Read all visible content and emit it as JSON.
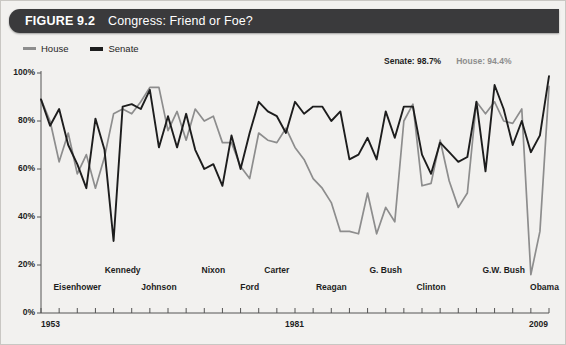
{
  "header": {
    "figure_number": "FIGURE 9.2",
    "title": "Congress: Friend or Foe?"
  },
  "legend": {
    "items": [
      {
        "label": "House",
        "color": "#8d8d8d"
      },
      {
        "label": "Senate",
        "color": "#1d1d1d"
      }
    ]
  },
  "annotations": [
    {
      "label": "Senate: 98.7%",
      "color": "#1d1d1d"
    },
    {
      "label": "House: 94.4%",
      "color": "#8d8d8d"
    }
  ],
  "axis": {
    "y_ticks": [
      "0%",
      "20%",
      "40%",
      "60%",
      "80%",
      "100%"
    ],
    "x_start_label": "1953",
    "x_mid_label": "1981",
    "x_end_label": "2009"
  },
  "presidents": [
    {
      "name": "Eisenhower",
      "year": 1957,
      "row": 1
    },
    {
      "name": "Kennedy",
      "year": 1962,
      "row": 0
    },
    {
      "name": "Johnson",
      "year": 1966,
      "row": 1
    },
    {
      "name": "Nixon",
      "year": 1972,
      "row": 0
    },
    {
      "name": "Ford",
      "year": 1976,
      "row": 1
    },
    {
      "name": "Carter",
      "year": 1979,
      "row": 0
    },
    {
      "name": "Reagan",
      "year": 1985,
      "row": 1
    },
    {
      "name": "G. Bush",
      "year": 1991,
      "row": 0
    },
    {
      "name": "Clinton",
      "year": 1996,
      "row": 1
    },
    {
      "name": "G.W. Bush",
      "year": 2004,
      "row": 0
    },
    {
      "name": "Obama",
      "year": 2008.5,
      "row": 1
    }
  ],
  "chart_data": {
    "type": "line",
    "title": "Congress: Friend or Foe?",
    "xlabel": "",
    "ylabel": "Presidential support score",
    "xlim": [
      1953,
      2009
    ],
    "ylim": [
      0,
      100
    ],
    "grid": false,
    "legend_position": "top-left",
    "x": [
      1953,
      1954,
      1955,
      1956,
      1957,
      1958,
      1959,
      1960,
      1961,
      1962,
      1963,
      1964,
      1965,
      1966,
      1967,
      1968,
      1969,
      1970,
      1971,
      1972,
      1973,
      1974,
      1975,
      1976,
      1977,
      1978,
      1979,
      1980,
      1981,
      1982,
      1983,
      1984,
      1985,
      1986,
      1987,
      1988,
      1989,
      1990,
      1991,
      1992,
      1993,
      1994,
      1995,
      1996,
      1997,
      1998,
      1999,
      2000,
      2001,
      2002,
      2003,
      2004,
      2005,
      2006,
      2007,
      2008,
      2009
    ],
    "series": [
      {
        "name": "House",
        "color": "#8d8d8d",
        "values": [
          89,
          80,
          63,
          75,
          58,
          66,
          52,
          65,
          83,
          85,
          83,
          88,
          94,
          94,
          76,
          84,
          72,
          85,
          80,
          82,
          71,
          71,
          61,
          56,
          75,
          72,
          71,
          77,
          69,
          64,
          56,
          52,
          46,
          34,
          34,
          33,
          50,
          33,
          44,
          38,
          80,
          87,
          53,
          54,
          72,
          55,
          44,
          50,
          88,
          83,
          88,
          80,
          79,
          85,
          16,
          34,
          94.4
        ]
      },
      {
        "name": "Senate",
        "color": "#1d1d1d",
        "values": [
          89,
          78,
          85,
          70,
          62,
          52,
          81,
          68,
          30,
          86,
          87,
          85,
          93,
          69,
          82,
          69,
          83,
          68,
          60,
          62,
          53,
          74,
          60,
          75,
          88,
          84,
          82,
          75,
          88,
          83,
          86,
          86,
          80,
          84,
          64,
          66,
          73,
          64,
          84,
          73,
          86,
          86,
          66,
          58,
          71,
          67,
          63,
          65,
          88,
          59,
          95,
          85,
          70,
          80,
          67,
          74,
          98.7
        ]
      }
    ]
  }
}
